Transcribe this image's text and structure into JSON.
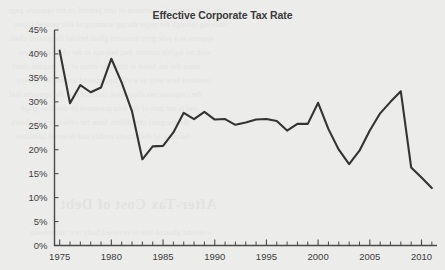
{
  "chart_data": {
    "type": "line",
    "title": "Effective Corporate Tax Rate",
    "xlabel": "",
    "ylabel": "",
    "xlim": [
      1974.5,
      2011.5
    ],
    "ylim": [
      0,
      45
    ],
    "grid": false,
    "legend": null,
    "y_tick_labels": [
      "0%",
      "5%",
      "10%",
      "15%",
      "20%",
      "25%",
      "30%",
      "35%",
      "40%",
      "45%"
    ],
    "y_ticks": [
      0,
      5,
      10,
      15,
      20,
      25,
      30,
      35,
      40,
      45
    ],
    "x_tick_labels": [
      "1975",
      "1980",
      "1985",
      "1990",
      "1995",
      "2000",
      "2005",
      "2010"
    ],
    "x_ticks": [
      1975,
      1980,
      1985,
      1990,
      1995,
      2000,
      2005,
      2010
    ],
    "x_minor_ticks_every": 1,
    "x": [
      1975,
      1976,
      1977,
      1978,
      1979,
      1980,
      1981,
      1982,
      1983,
      1984,
      1985,
      1986,
      1987,
      1988,
      1989,
      1990,
      1991,
      1992,
      1993,
      1994,
      1995,
      1996,
      1997,
      1998,
      1999,
      2000,
      2001,
      2002,
      2003,
      2004,
      2005,
      2006,
      2007,
      2008,
      2009,
      2010,
      2011
    ],
    "values": [
      40.7,
      29.7,
      33.5,
      32.0,
      33.0,
      39.0,
      34.0,
      28.0,
      18.0,
      20.7,
      20.8,
      23.6,
      27.7,
      26.4,
      27.9,
      26.3,
      26.4,
      25.2,
      25.7,
      26.3,
      26.4,
      26.0,
      24.0,
      25.4,
      25.4,
      29.8,
      24.3,
      20.0,
      17.0,
      19.8,
      24.0,
      27.6,
      30.0,
      32.2,
      16.3,
      14.2,
      12.0
    ],
    "series_name": "Effective Corporate Tax Rate",
    "line_color": "#333333",
    "background_color": "#ececeb"
  },
  "bleed_through": {
    "heading": "After-Tax Cost of Debt",
    "filler": "the reverse side of the scanned page shows through faintly"
  }
}
